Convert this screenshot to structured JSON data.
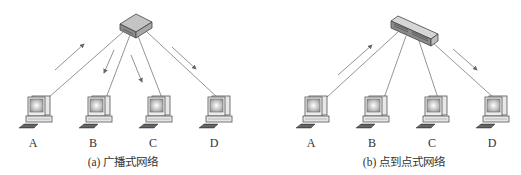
{
  "diagrams": [
    {
      "id": "broadcast",
      "caption": "(a) 广播式网络",
      "device": "hub",
      "nodes": [
        {
          "label": "A",
          "x": 40
        },
        {
          "label": "B",
          "x": 100
        },
        {
          "label": "C",
          "x": 160
        },
        {
          "label": "D",
          "x": 220
        }
      ],
      "arrows": [
        {
          "from_node": "A",
          "direction": "to-device"
        },
        {
          "to_node": "B",
          "direction": "from-device"
        },
        {
          "to_node": "C",
          "direction": "from-device"
        },
        {
          "to_node": "D",
          "direction": "from-device"
        }
      ]
    },
    {
      "id": "point-to-point",
      "caption": "(b) 点到点式网络",
      "device": "switch",
      "nodes": [
        {
          "label": "A",
          "x": 317
        },
        {
          "label": "B",
          "x": 377
        },
        {
          "label": "C",
          "x": 437
        },
        {
          "label": "D",
          "x": 497
        }
      ],
      "arrows": [
        {
          "from_node": "A",
          "direction": "to-device"
        },
        {
          "to_node": "D",
          "direction": "from-device"
        }
      ]
    }
  ],
  "colors": {
    "line": "#777777",
    "device_top": "#b8b8b8",
    "device_side": "#8a8a8a",
    "monitor_screen": "#d9d9d9"
  }
}
